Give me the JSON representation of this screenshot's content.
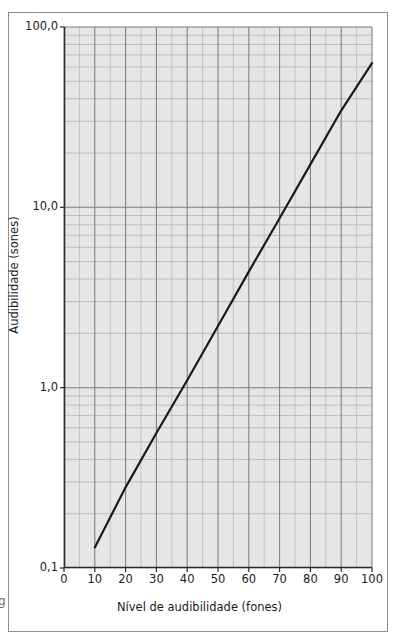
{
  "figure": {
    "stray_glyph": "g"
  },
  "axes": {
    "xlabel": "Nível de audibilidade (fones)",
    "ylabel": "Audibilidade (sones)",
    "xticks": [
      "0",
      "10",
      "20",
      "30",
      "40",
      "50",
      "60",
      "70",
      "80",
      "90",
      "100"
    ],
    "yticks": [
      "100,0",
      "10,0",
      "1,0",
      "0,1"
    ]
  },
  "colors": {
    "plot_background": "#e6e6e6",
    "major_grid": "#7d7d7d",
    "minor_grid": "#b4b4b4",
    "axis": "#2b2b2b",
    "data_line": "#1a1a1a",
    "frame": "#8d8d8d"
  },
  "chart_data": {
    "type": "line",
    "title": "",
    "subtitle": "",
    "xlabel": "Nível de audibilidade (fones)",
    "ylabel": "Audibilidade (sones)",
    "xscale": "linear",
    "yscale": "log",
    "xlim": [
      0,
      100
    ],
    "ylim": [
      0.1,
      100
    ],
    "grid": true,
    "legend": false,
    "xticks": [
      0,
      10,
      20,
      30,
      40,
      50,
      60,
      70,
      80,
      90,
      100
    ],
    "xtick_labels": [
      "0",
      "10",
      "20",
      "30",
      "40",
      "50",
      "60",
      "70",
      "80",
      "90",
      "100"
    ],
    "xminor_step": 5,
    "yticks": [
      0.1,
      1,
      10,
      100
    ],
    "ytick_labels": [
      "0,1",
      "1,0",
      "10,0",
      "100,0"
    ],
    "yminor_multipliers": [
      2,
      3,
      4,
      5,
      6,
      7,
      8,
      9
    ],
    "series": [
      {
        "name": "Audibilidade (sones) vs nível (fones)",
        "x": [
          10,
          20,
          30,
          40,
          50,
          60,
          70,
          80,
          90,
          100
        ],
        "y": [
          0.13,
          0.28,
          0.56,
          1.1,
          2.2,
          4.4,
          8.7,
          17.3,
          34.4,
          63.0
        ],
        "color": "#1a1a1a",
        "linewidth": 2.2
      }
    ],
    "annotations": []
  }
}
